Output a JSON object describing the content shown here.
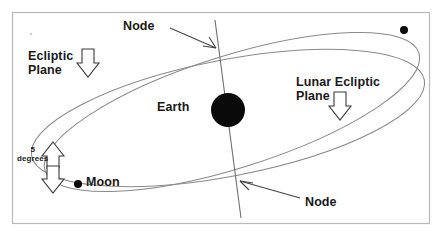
{
  "figure": {
    "background_color": "#ffffff",
    "border_color": "#b9b9b9",
    "orbit_color": "#8a8a8a",
    "body_color": "#0a0a0a",
    "label_color": "#1a1a1a"
  },
  "labels": {
    "node_top": "Node",
    "node_bottom": "Node",
    "ecliptic_plane": "Ecliptic\nPlane",
    "lunar_ecliptic_plane": "Lunar Ecliptic\nPlane",
    "earth": "Earth",
    "moon": "Moon",
    "inclination": "5\ndegrees"
  },
  "bodies": [
    {
      "name": "earth",
      "label": "Earth",
      "cx": 228,
      "cy": 110,
      "r": 17
    },
    {
      "name": "moon",
      "label": "Moon",
      "cx": 78,
      "cy": 184,
      "r": 4
    },
    {
      "name": "unlabeled-orbit-point",
      "label": "",
      "cx": 404,
      "cy": 30,
      "r": 4
    }
  ],
  "annotations": {
    "inclination_value": "5",
    "inclination_unit": "degrees",
    "node_count": 2
  },
  "icons": {
    "arrow_down": "block-arrow-down-icon",
    "arrow_up": "block-arrow-up-icon",
    "pointer": "leader-arrow-icon"
  }
}
